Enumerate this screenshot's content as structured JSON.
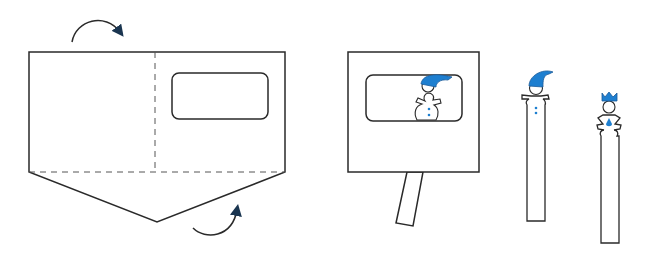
{
  "diagram": {
    "colors": {
      "line": "#2a2a2a",
      "accent_blue": "#1e7fd0",
      "background": "#ffffff"
    },
    "steps": [
      {
        "id": "fold-template",
        "elements": [
          "pentagon-card",
          "vertical-fold-line",
          "horizontal-fold-line",
          "window-cutout",
          "fold-arrow-top",
          "fold-arrow-bottom"
        ]
      },
      {
        "id": "assembled-theatre",
        "elements": [
          "theatre-box",
          "theatre-window",
          "snowman-in-window",
          "handle-stick"
        ]
      },
      {
        "id": "snowman-puppet",
        "elements": [
          "snowman-head",
          "blue-hat",
          "stick"
        ]
      },
      {
        "id": "queen-puppet",
        "elements": [
          "crown",
          "head",
          "dress",
          "stick"
        ]
      }
    ]
  }
}
